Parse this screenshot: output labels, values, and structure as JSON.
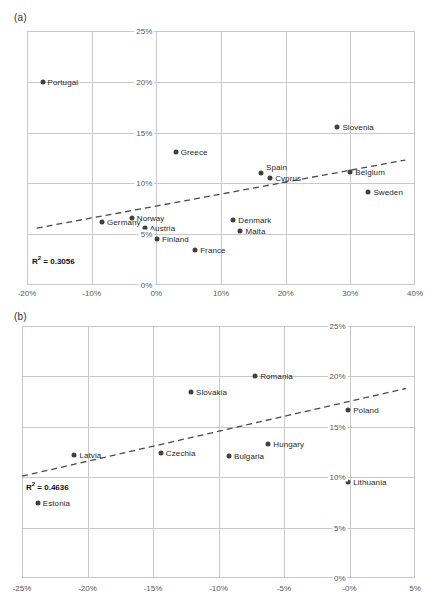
{
  "figures": [
    {
      "panel": "(a)",
      "r2_prefix": "R",
      "r2_sup": "2",
      "r2_text": " = 0.3056",
      "r2_value": 0.3056
    },
    {
      "panel": "(b)",
      "r2_prefix": "R",
      "r2_sup": "2",
      "r2_text": " = 0.4636",
      "r2_value": 0.4636
    }
  ],
  "chart_data": [
    {
      "type": "scatter",
      "title": "(a)",
      "xlabel": "",
      "ylabel": "",
      "xlim": [
        -20,
        40
      ],
      "ylim": [
        0,
        25
      ],
      "xticks": [
        -20,
        -10,
        0,
        10,
        20,
        30,
        40
      ],
      "xtick_labels": [
        "-20%",
        "-10%",
        "0%",
        "10%",
        "20%",
        "30%",
        "40%"
      ],
      "yticks": [
        0,
        5,
        10,
        15,
        20,
        25
      ],
      "ytick_labels": [
        "0%",
        "5%",
        "10%",
        "15%",
        "20%",
        "25%"
      ],
      "grid": true,
      "legend": "none",
      "annotations": [
        "R² = 0.3056"
      ],
      "trendline": {
        "type": "dashed",
        "x0": -18.5,
        "y0": 5.6,
        "x1": 38.5,
        "y1": 12.3
      },
      "points": [
        {
          "label": "Portugal",
          "x": -17.6,
          "y": 20.0,
          "label_side": "right"
        },
        {
          "label": "Greece",
          "x": 3.0,
          "y": 13.1,
          "label_side": "right"
        },
        {
          "label": "Slovenia",
          "x": 28.0,
          "y": 15.6,
          "label_side": "right"
        },
        {
          "label": "Spain",
          "x": 16.2,
          "y": 11.0,
          "label_side": "above-right"
        },
        {
          "label": "Cyprus",
          "x": 17.6,
          "y": 10.5,
          "label_side": "right"
        },
        {
          "label": "Belgium",
          "x": 30.0,
          "y": 11.1,
          "label_side": "right"
        },
        {
          "label": "Sweden",
          "x": 32.8,
          "y": 9.2,
          "label_side": "right"
        },
        {
          "label": "Norway",
          "x": -3.8,
          "y": 6.6,
          "label_side": "right"
        },
        {
          "label": "Germany",
          "x": -8.4,
          "y": 6.2,
          "label_side": "right"
        },
        {
          "label": "Austria",
          "x": -1.8,
          "y": 5.6,
          "label_side": "right"
        },
        {
          "label": "Denmark",
          "x": 11.9,
          "y": 6.4,
          "label_side": "right"
        },
        {
          "label": "Malta",
          "x": 13.0,
          "y": 5.3,
          "label_side": "right"
        },
        {
          "label": "Finland",
          "x": 0.1,
          "y": 4.5,
          "label_side": "right"
        },
        {
          "label": "France",
          "x": 6.0,
          "y": 3.4,
          "label_side": "right"
        }
      ]
    },
    {
      "type": "scatter",
      "title": "(b)",
      "xlabel": "",
      "ylabel": "",
      "xlim": [
        -25,
        5
      ],
      "ylim": [
        0,
        25
      ],
      "xticks": [
        -25,
        -20,
        -15,
        -10,
        -5,
        0,
        5
      ],
      "xtick_labels": [
        "-25%",
        "-20%",
        "-15%",
        "-10%",
        "-5%",
        "-0%",
        "5%"
      ],
      "yticks": [
        0,
        5,
        10,
        15,
        20,
        25
      ],
      "ytick_labels": [
        "0%",
        "5%",
        "10%",
        "15%",
        "20%",
        "25%"
      ],
      "grid": true,
      "legend": "none",
      "annotations": [
        "R² = 0.4636"
      ],
      "trendline": {
        "type": "dashed",
        "x0": -25.0,
        "y0": 10.1,
        "x1": 4.3,
        "y1": 18.8
      },
      "points": [
        {
          "label": "Romania",
          "x": -7.2,
          "y": 20.0,
          "label_side": "right"
        },
        {
          "label": "Slovakia",
          "x": -12.1,
          "y": 18.5,
          "label_side": "right"
        },
        {
          "label": "Poland",
          "x": -0.1,
          "y": 16.7,
          "label_side": "right"
        },
        {
          "label": "Hungary",
          "x": -6.2,
          "y": 13.3,
          "label_side": "right"
        },
        {
          "label": "Czechia",
          "x": -14.4,
          "y": 12.4,
          "label_side": "right"
        },
        {
          "label": "Bulgaria",
          "x": -9.2,
          "y": 12.1,
          "label_side": "right"
        },
        {
          "label": "Latvia",
          "x": -21.0,
          "y": 12.2,
          "label_side": "right"
        },
        {
          "label": "Lithuania",
          "x": -0.1,
          "y": 9.5,
          "label_side": "right"
        },
        {
          "label": "Estonia",
          "x": -23.8,
          "y": 7.4,
          "label_side": "right"
        }
      ]
    }
  ]
}
